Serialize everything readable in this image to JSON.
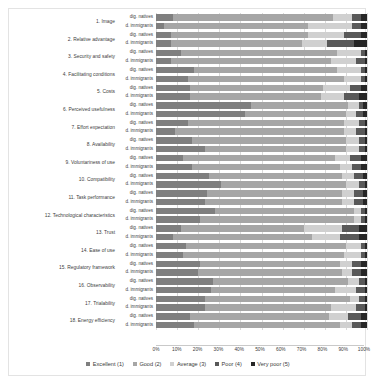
{
  "chart_data": {
    "type": "bar",
    "subtype": "100%-stacked-horizontal",
    "title": "",
    "xlabel": "",
    "ylabel": "",
    "xlim": [
      0,
      100
    ],
    "xticks": [
      "0%",
      "10%",
      "20%",
      "30%",
      "40%",
      "50%",
      "60%",
      "70%",
      "80%",
      "90%",
      "100%"
    ],
    "grid": true,
    "legend_position": "bottom",
    "legend": [
      "Excellent (1)",
      "Good (2)",
      "Average (3)",
      "Poor (4)",
      "Very poor (5)"
    ],
    "series_colors": [
      "#7f7f7f",
      "#a6a6a6",
      "#d0d0d0",
      "#595959",
      "#262626"
    ],
    "group_labels": [
      "dig. natives",
      "d. immigrants"
    ],
    "categories": [
      "1. Image",
      "2. Relative advantage",
      "3. Security and safety",
      "4. Facilitating conditions",
      "5. Costs",
      "6. Perceived usefulness",
      "7. Effort expectation",
      "8. Availability",
      "9. Voluntariness of use",
      "10. Compatibility",
      "11. Task performance",
      "12. Technological characteristics",
      "13. Trust",
      "14. Ease of use",
      "15. Regulatory framework",
      "16. Observability",
      "17. Trialability",
      "18. Energy efficiency"
    ],
    "rows": [
      {
        "category": "1. Image",
        "group": "dig. natives",
        "values": [
          8,
          76,
          9,
          4,
          3
        ]
      },
      {
        "category": "1. Image",
        "group": "d. immigrants",
        "values": [
          4,
          68,
          21,
          4,
          3
        ]
      },
      {
        "category": "2. Relative advantage",
        "group": "dig. natives",
        "values": [
          7,
          65,
          17,
          8,
          3
        ]
      },
      {
        "category": "2. Relative advantage",
        "group": "d. immigrants",
        "values": [
          7,
          62,
          12,
          13,
          6
        ]
      },
      {
        "category": "3. Security and safety",
        "group": "dig. natives",
        "values": [
          12,
          74,
          11,
          2,
          1
        ]
      },
      {
        "category": "3. Security and safety",
        "group": "d. immigrants",
        "values": [
          7,
          76,
          12,
          4,
          1
        ]
      },
      {
        "category": "4. Facilitating conditions",
        "group": "dig. natives",
        "values": [
          18,
          68,
          11,
          2,
          1
        ]
      },
      {
        "category": "4. Facilitating conditions",
        "group": "d. immigrants",
        "values": [
          15,
          74,
          8,
          2,
          1
        ]
      },
      {
        "category": "5. Costs",
        "group": "dig. natives",
        "values": [
          16,
          63,
          13,
          5,
          3
        ]
      },
      {
        "category": "5. Costs",
        "group": "d. immigrants",
        "values": [
          16,
          62,
          11,
          7,
          4
        ]
      },
      {
        "category": "6. Perceived usefulness",
        "group": "dig. natives",
        "values": [
          45,
          46,
          5,
          2,
          2
        ]
      },
      {
        "category": "6. Perceived usefulness",
        "group": "d. immigrants",
        "values": [
          42,
          48,
          5,
          3,
          2
        ]
      },
      {
        "category": "7. Effort expectation",
        "group": "dig. natives",
        "values": [
          15,
          74,
          7,
          3,
          1
        ]
      },
      {
        "category": "7. Effort expectation",
        "group": "d. immigrants",
        "values": [
          9,
          80,
          6,
          4,
          1
        ]
      },
      {
        "category": "8. Availability",
        "group": "dig. natives",
        "values": [
          17,
          73,
          6,
          3,
          1
        ]
      },
      {
        "category": "8. Availability",
        "group": "d. immigrants",
        "values": [
          23,
          67,
          6,
          3,
          1
        ]
      },
      {
        "category": "9. Voluntariness of use",
        "group": "dig. natives",
        "values": [
          13,
          72,
          7,
          5,
          3
        ]
      },
      {
        "category": "9. Voluntariness of use",
        "group": "d. immigrants",
        "values": [
          17,
          70,
          6,
          4,
          3
        ]
      },
      {
        "category": "10. Compatibility",
        "group": "dig. natives",
        "values": [
          25,
          63,
          6,
          4,
          2
        ]
      },
      {
        "category": "10. Compatibility",
        "group": "d. immigrants",
        "values": [
          31,
          59,
          6,
          3,
          1
        ]
      },
      {
        "category": "11. Task performance",
        "group": "dig. natives",
        "values": [
          24,
          64,
          6,
          4,
          2
        ]
      },
      {
        "category": "11. Task performance",
        "group": "d. immigrants",
        "values": [
          23,
          65,
          6,
          4,
          2
        ]
      },
      {
        "category": "12. Technological characteristics",
        "group": "dig. natives",
        "values": [
          28,
          66,
          3,
          2,
          1
        ]
      },
      {
        "category": "12. Technological characteristics",
        "group": "d. immigrants",
        "values": [
          21,
          73,
          3,
          2,
          1
        ]
      },
      {
        "category": "13. Trust",
        "group": "dig. natives",
        "values": [
          12,
          58,
          18,
          8,
          4
        ]
      },
      {
        "category": "13. Trust",
        "group": "d. immigrants",
        "values": [
          8,
          66,
          13,
          9,
          4
        ]
      },
      {
        "category": "14. Ease of use",
        "group": "dig. natives",
        "values": [
          14,
          76,
          7,
          2,
          1
        ]
      },
      {
        "category": "14. Ease of use",
        "group": "d. immigrants",
        "values": [
          13,
          76,
          8,
          2,
          1
        ]
      },
      {
        "category": "15. Regulatory framework",
        "group": "dig. natives",
        "values": [
          21,
          66,
          6,
          4,
          3
        ]
      },
      {
        "category": "15. Regulatory framework",
        "group": "d. immigrants",
        "values": [
          20,
          68,
          5,
          4,
          3
        ]
      },
      {
        "category": "16. Observability",
        "group": "dig. natives",
        "values": [
          27,
          64,
          5,
          3,
          1
        ]
      },
      {
        "category": "16. Observability",
        "group": "d. immigrants",
        "values": [
          26,
          59,
          10,
          4,
          1
        ]
      },
      {
        "category": "17. Trialability",
        "group": "dig. natives",
        "values": [
          23,
          69,
          4,
          3,
          1
        ]
      },
      {
        "category": "17. Trialability",
        "group": "d. immigrants",
        "values": [
          23,
          60,
          12,
          4,
          1
        ]
      },
      {
        "category": "18. Energy efficiency",
        "group": "dig. natives",
        "values": [
          16,
          66,
          9,
          6,
          3
        ]
      },
      {
        "category": "18. Energy efficiency",
        "group": "d. immigrants",
        "values": [
          18,
          69,
          6,
          4,
          3
        ]
      }
    ]
  }
}
